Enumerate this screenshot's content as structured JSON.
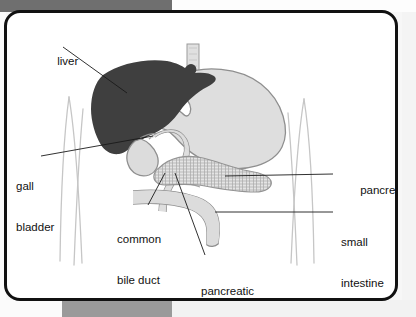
{
  "figure": {
    "kind": "anatomical-diagram",
    "frame": {
      "border_color": "#111111",
      "background_color": "#ffffff"
    },
    "colors": {
      "liver_fill": "#3f3f3f",
      "organ_fill": "#dedede",
      "organ_stroke": "#8a8a8a",
      "duct_fill": "#d9d9d9",
      "pancreas_fill": "#e2e2e2",
      "body_outline": "#c9c9c9",
      "leader_line": "#1a1a1a",
      "label_text": "#111111",
      "page_band_dark": "#6f6f6f",
      "page_band_mid": "#9a9a9a"
    },
    "labels": [
      {
        "id": "liver",
        "text": "liver",
        "lines": [
          "liver"
        ]
      },
      {
        "id": "gall-bladder",
        "text": "gall bladder",
        "lines": [
          "gall",
          "bladder"
        ]
      },
      {
        "id": "common-bile-duct",
        "text": "common bile duct",
        "lines": [
          "common",
          "bile duct"
        ]
      },
      {
        "id": "pancreatic-duct",
        "text": "pancreatic duct",
        "lines": [
          "pancreatic",
          "duct"
        ]
      },
      {
        "id": "pancreas",
        "text": "pancreas",
        "lines": [
          "pancreas"
        ]
      },
      {
        "id": "small-intestine",
        "text": "small intestine",
        "lines": [
          "small",
          "intestine"
        ]
      }
    ],
    "label_text": {
      "liver": "liver",
      "gall_line1": "gall",
      "gall_line2": "bladder",
      "common_line1": "common",
      "common_line2": "bile duct",
      "pancreatic_line1": "pancreatic",
      "pancreatic_line2": "duct",
      "pancreas": "pancreas",
      "small_line1": "small",
      "small_line2": "intestine"
    },
    "organs": [
      {
        "id": "liver",
        "name": "liver",
        "shading": "dark solid"
      },
      {
        "id": "stomach",
        "name": "stomach",
        "shading": "light gray fill"
      },
      {
        "id": "esophagus",
        "name": "esophagus",
        "shading": "light gray fill"
      },
      {
        "id": "gall-bladder",
        "name": "gall bladder",
        "shading": "light gray fill"
      },
      {
        "id": "pancreas",
        "name": "pancreas",
        "shading": "lobulated texture"
      },
      {
        "id": "duodenum",
        "name": "small intestine",
        "shading": "light gray fill"
      },
      {
        "id": "common-bile-duct",
        "name": "common bile duct",
        "shading": "light gray tube"
      },
      {
        "id": "pancreatic-duct",
        "name": "pancreatic duct",
        "shading": "light gray tube"
      }
    ]
  }
}
